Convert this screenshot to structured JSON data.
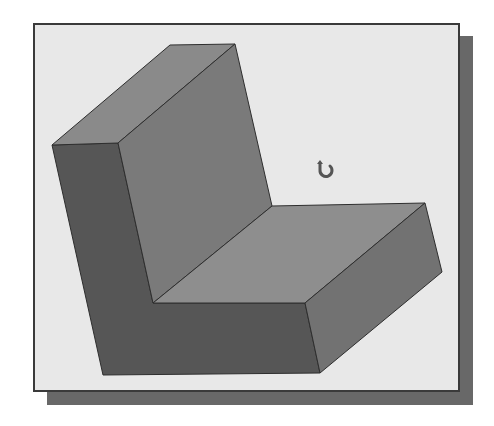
{
  "scene": {
    "type": "3D solid model viewport",
    "model": "L-shaped block (isometric, shaded)",
    "background_color": "#e8e8e8",
    "frame_border_color": "#3a3a3a",
    "shadow_color": "#686868",
    "faces": {
      "upright_top": {
        "color": "#8a8a8a",
        "points": "52,145 170,45 235,44 118,143"
      },
      "upright_inner_wall": {
        "color": "#7a7a7a",
        "points": "118,143 235,44 272,206 153,303"
      },
      "seat_top": {
        "color": "#8e8e8e",
        "points": "153,303 272,206 425,203 305,303"
      },
      "right_side": {
        "color": "#727272",
        "points": "305,303 425,203 442,272 320,373"
      },
      "front_face": {
        "color": "#565656",
        "points": "52,145 118,143 153,303 305,303 320,373 103,375"
      }
    },
    "edge_color": "#2e2e2e"
  },
  "cursor": {
    "icon": "rotate-orbit-icon",
    "color": "#555555"
  }
}
